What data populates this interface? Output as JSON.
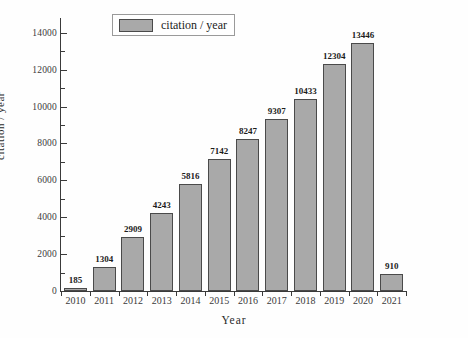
{
  "chart_data": {
    "type": "bar",
    "title": "",
    "xlabel": "Year",
    "ylabel": "citation / year",
    "categories": [
      "2010",
      "2011",
      "2012",
      "2013",
      "2014",
      "2015",
      "2016",
      "2017",
      "2018",
      "2019",
      "2020",
      "2021"
    ],
    "values": [
      185,
      1304,
      2909,
      4243,
      5816,
      7142,
      8247,
      9307,
      10433,
      12304,
      13446,
      910
    ],
    "value_labels": [
      "185",
      "1304",
      "2909",
      "4243",
      "5816",
      "7142",
      "8247",
      "9307",
      "10433",
      "12304",
      "13446",
      "910"
    ],
    "series": [
      {
        "name": "citation / year",
        "values": [
          185,
          1304,
          2909,
          4243,
          5816,
          7142,
          8247,
          9307,
          10433,
          12304,
          13446,
          910
        ]
      }
    ],
    "ylim": [
      0,
      14800
    ],
    "ytick_values": [
      0,
      2000,
      4000,
      6000,
      8000,
      10000,
      12000,
      14000
    ],
    "ytick_labels": [
      "0",
      "2000",
      "4000",
      "6000",
      "8000",
      "10000",
      "12000",
      "14000"
    ],
    "yminor_tick_values": [
      1000,
      3000,
      5000,
      7000,
      9000,
      11000,
      13000
    ],
    "grid": false,
    "legend": {
      "position": "top-center",
      "entries": [
        {
          "label": "citation / year",
          "color": "#a9a9a9"
        }
      ]
    },
    "colors": {
      "bar_fill": "#a9a9a9",
      "bar_border": "#4a4a4a",
      "axis": "#3a3a3a",
      "text": "#1c1c1c",
      "background": "#ffffff"
    }
  }
}
